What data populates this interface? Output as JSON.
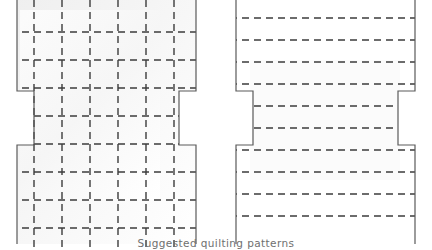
{
  "figure": {
    "caption": "Suggested quilting patterns",
    "caption_color": "#6f6f6f",
    "background_color": "#ffffff",
    "outline_color": "#5a5a5a",
    "dash_color": "#3c3c3c",
    "fill_color": "#f2f2f2",
    "fill_color_light": "#fafafa",
    "width": 432,
    "height": 250
  },
  "diagrams": [
    {
      "id": "left-pattern",
      "name": "grid-quilting-pattern",
      "label": "Grid quilting pattern",
      "description": "Cross-shaped quilt block with side notches, quilted in a crosshatch grid of dashed stitching lines",
      "shaded": true,
      "shape": {
        "left_edge_x": 17,
        "right_edge_x": 196,
        "notch_left_x": 34,
        "notch_right_x": 179,
        "notch_top_y": 91,
        "notch_bottom_y": 145,
        "top_y": -12,
        "bottom_y": 244
      },
      "stitch_lines": {
        "vertical_x": [
          34,
          62,
          90,
          118,
          146,
          174
        ],
        "horizontal_y": [
          32,
          60,
          88,
          116,
          144,
          172,
          200,
          228
        ],
        "dash_pattern": "7,5",
        "stroke_width": 1.4
      }
    },
    {
      "id": "right-pattern",
      "name": "horizontal-line-quilting-pattern",
      "label": "Horizontal line quilting pattern",
      "description": "Cross-shaped quilt block with side notches, quilted in evenly spaced horizontal dashed stitching lines only",
      "shaded": false,
      "shape": {
        "left_edge_x": 236,
        "right_edge_x": 415,
        "notch_left_x": 253,
        "notch_right_x": 398,
        "notch_top_y": 91,
        "notch_bottom_y": 145,
        "top_y": -12,
        "bottom_y": 244
      },
      "stitch_lines": {
        "vertical_x": [],
        "horizontal_y": [
          18,
          40,
          62,
          84,
          106,
          128,
          150,
          172,
          194,
          216
        ],
        "dash_pattern": "7,5",
        "stroke_width": 1.4
      }
    }
  ]
}
